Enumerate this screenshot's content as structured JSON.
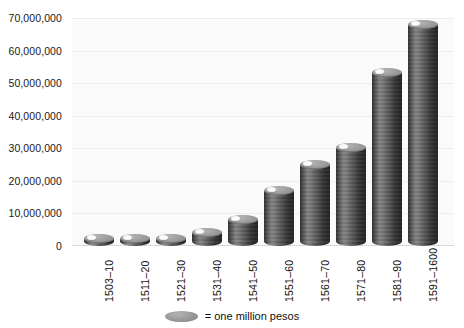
{
  "chart_data": {
    "type": "bar",
    "title": "",
    "subtitle": "",
    "xlabel": "",
    "ylabel": "",
    "categories": [
      "1503–10",
      "1511–20",
      "1521–30",
      "1531–40",
      "1541–50",
      "1551–60",
      "1561–70",
      "1571–80",
      "1581–90",
      "1591–1600"
    ],
    "values": [
      1000000,
      1500000,
      1000000,
      4000000,
      8000000,
      17000000,
      25000000,
      30000000,
      53000000,
      68000000
    ],
    "ylim": [
      0,
      70000000
    ],
    "ytick_values": [
      0,
      10000000,
      20000000,
      30000000,
      40000000,
      50000000,
      60000000,
      70000000
    ],
    "ytick_labels": [
      "0",
      "10,000,000",
      "20,000,000",
      "30,000,000",
      "40,000,000",
      "50,000,000",
      "60,000,000",
      "70,000,000"
    ],
    "grid": true,
    "legend_position": "bottom",
    "legend": [
      {
        "marker": "coin-icon",
        "label": "= one million pesos"
      }
    ],
    "unit_per_marker": 1000000,
    "bar_style": "stacked-coins",
    "colors": {
      "bar_fill": "#8e8e8e",
      "bar_highlight": "#ababab",
      "bar_shadow": "#6a6a6a",
      "plot_background": "#fafafa",
      "gridline": "#ededed",
      "axis_text": "#111111"
    }
  },
  "legend": {
    "marker_name": "coin-icon",
    "text": "= one million pesos"
  }
}
